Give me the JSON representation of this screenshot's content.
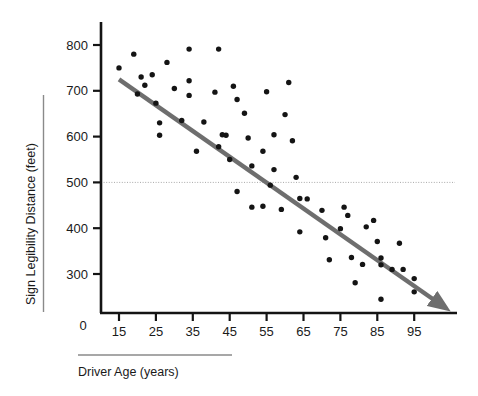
{
  "chart_data": {
    "type": "scatter",
    "title": "",
    "xlabel": "Driver Age (years)",
    "ylabel": "Sign Legibility Distance (feet)",
    "xlim": [
      10,
      102
    ],
    "ylim": [
      180,
      840
    ],
    "xticks": [
      15,
      25,
      35,
      45,
      55,
      65,
      75,
      85,
      95
    ],
    "yticks": [
      300,
      400,
      500,
      600,
      700,
      800
    ],
    "y_origin_label": "0",
    "grid": false,
    "legend": null,
    "reference_lines": [
      {
        "name": "500-foot-reference",
        "orientation": "horizontal",
        "value": 500,
        "style": "dotted",
        "color": "#a8a8a8"
      }
    ],
    "trend_line": {
      "name": "regression-trend-arrow",
      "style": "solid-arrow",
      "color": "#6e6e6e",
      "x_start": 15,
      "y_start": 725,
      "x_end": 101,
      "y_end": 240
    },
    "points": [
      {
        "x": 15,
        "y": 750
      },
      {
        "x": 19,
        "y": 780
      },
      {
        "x": 20,
        "y": 693
      },
      {
        "x": 21,
        "y": 730
      },
      {
        "x": 22,
        "y": 712
      },
      {
        "x": 24,
        "y": 735
      },
      {
        "x": 25,
        "y": 673
      },
      {
        "x": 26,
        "y": 630
      },
      {
        "x": 26,
        "y": 603
      },
      {
        "x": 28,
        "y": 762
      },
      {
        "x": 30,
        "y": 705
      },
      {
        "x": 32,
        "y": 635
      },
      {
        "x": 34,
        "y": 722
      },
      {
        "x": 34,
        "y": 690
      },
      {
        "x": 34,
        "y": 791
      },
      {
        "x": 36,
        "y": 568
      },
      {
        "x": 38,
        "y": 632
      },
      {
        "x": 41,
        "y": 697
      },
      {
        "x": 42,
        "y": 791
      },
      {
        "x": 42,
        "y": 578
      },
      {
        "x": 43,
        "y": 604
      },
      {
        "x": 44,
        "y": 603
      },
      {
        "x": 45,
        "y": 550
      },
      {
        "x": 46,
        "y": 710
      },
      {
        "x": 47,
        "y": 681
      },
      {
        "x": 47,
        "y": 480
      },
      {
        "x": 49,
        "y": 651
      },
      {
        "x": 50,
        "y": 597
      },
      {
        "x": 51,
        "y": 536
      },
      {
        "x": 51,
        "y": 446
      },
      {
        "x": 54,
        "y": 448
      },
      {
        "x": 54,
        "y": 568
      },
      {
        "x": 55,
        "y": 698
      },
      {
        "x": 56,
        "y": 494
      },
      {
        "x": 57,
        "y": 604
      },
      {
        "x": 57,
        "y": 528
      },
      {
        "x": 59,
        "y": 441
      },
      {
        "x": 60,
        "y": 648
      },
      {
        "x": 61,
        "y": 718
      },
      {
        "x": 62,
        "y": 591
      },
      {
        "x": 63,
        "y": 511
      },
      {
        "x": 64,
        "y": 465
      },
      {
        "x": 64,
        "y": 392
      },
      {
        "x": 66,
        "y": 464
      },
      {
        "x": 70,
        "y": 439
      },
      {
        "x": 71,
        "y": 379
      },
      {
        "x": 72,
        "y": 331
      },
      {
        "x": 75,
        "y": 399
      },
      {
        "x": 76,
        "y": 446
      },
      {
        "x": 77,
        "y": 428
      },
      {
        "x": 78,
        "y": 336
      },
      {
        "x": 79,
        "y": 281
      },
      {
        "x": 81,
        "y": 321
      },
      {
        "x": 82,
        "y": 403
      },
      {
        "x": 84,
        "y": 417
      },
      {
        "x": 85,
        "y": 371
      },
      {
        "x": 86,
        "y": 335
      },
      {
        "x": 86,
        "y": 320
      },
      {
        "x": 86,
        "y": 245
      },
      {
        "x": 89,
        "y": 310
      },
      {
        "x": 91,
        "y": 367
      },
      {
        "x": 92,
        "y": 310
      },
      {
        "x": 95,
        "y": 290
      },
      {
        "x": 95,
        "y": 261
      }
    ]
  },
  "axis": {
    "x_title": "Driver Age (years)",
    "y_title": "Sign Legibility Distance (feet)",
    "zero_label": "0",
    "x_tick_labels": [
      "15",
      "25",
      "35",
      "45",
      "55",
      "65",
      "75",
      "85",
      "95"
    ],
    "y_tick_labels": [
      "300",
      "400",
      "500",
      "600",
      "700",
      "800"
    ]
  },
  "colors": {
    "point": "#141414",
    "axis": "#141414",
    "trend": "#6e6e6e",
    "reference": "#b0b0b0",
    "underline": "#8a8a8a",
    "text": "#1a1a1a",
    "background": "#ffffff"
  }
}
